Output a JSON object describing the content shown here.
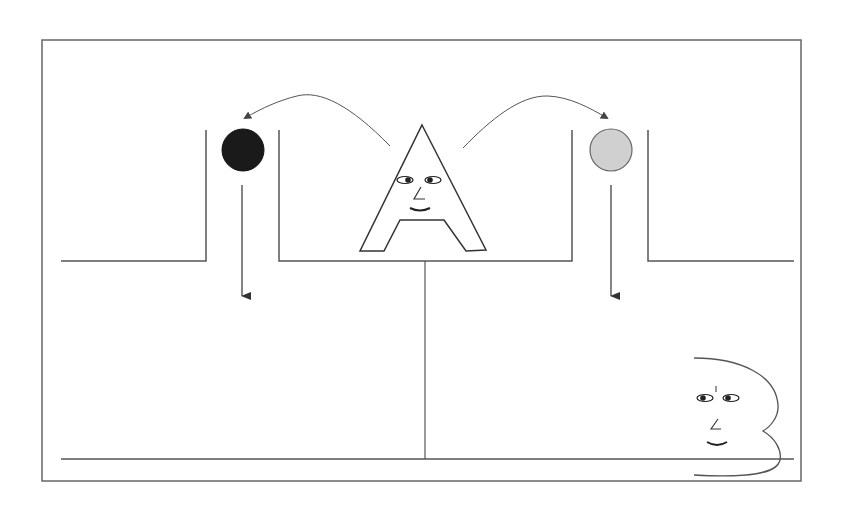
{
  "diagram": {
    "characters": [
      {
        "id": "A",
        "label": "A",
        "role": "thrower"
      },
      {
        "id": "B",
        "label": "B",
        "role": "receiver"
      }
    ],
    "balls": [
      {
        "id": "ball-left",
        "color": "#1a1a1a",
        "label": "black ball"
      },
      {
        "id": "ball-right",
        "color": "#d0d0d0",
        "label": "grey ball"
      }
    ],
    "arrows": [
      {
        "id": "arc-left",
        "from": "A",
        "to": "ball-left",
        "type": "curved"
      },
      {
        "id": "arc-right",
        "from": "A",
        "to": "ball-right",
        "type": "curved"
      },
      {
        "id": "drop-left",
        "from": "ball-left",
        "to": "left-compartment",
        "type": "straight-down"
      },
      {
        "id": "drop-right",
        "from": "ball-right",
        "to": "right-compartment",
        "type": "straight-down"
      }
    ],
    "colors": {
      "line": "#555555",
      "frame": "#666666",
      "ball_dark": "#1a1a1a",
      "ball_light": "#d0d0d0",
      "background": "#ffffff"
    }
  }
}
